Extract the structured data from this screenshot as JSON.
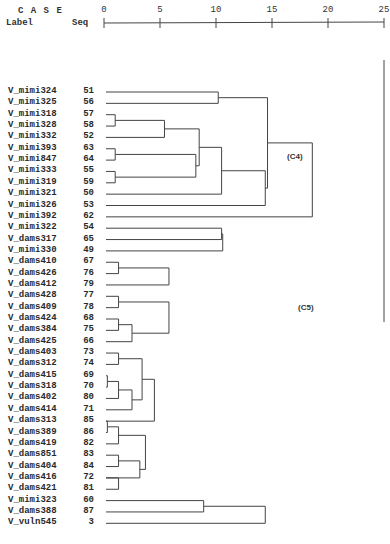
{
  "header": {
    "case_label": "C A S E",
    "label_col": "Label",
    "seq_col": "Seq"
  },
  "chart_data": {
    "type": "dendrogram",
    "title": "",
    "xlabel": "Rescaled Distance Cluster Combine",
    "axis_ticks": [
      0,
      5,
      10,
      15,
      20,
      25
    ],
    "xlim": [
      0,
      25
    ],
    "leaves": [
      {
        "label": "V_mimi324",
        "seq": 51
      },
      {
        "label": "V_mimi325",
        "seq": 56
      },
      {
        "label": "V_mimi318",
        "seq": 57
      },
      {
        "label": "V_mimi328",
        "seq": 58
      },
      {
        "label": "V_mimi332",
        "seq": 52
      },
      {
        "label": "V_mimi393",
        "seq": 63
      },
      {
        "label": "V_mimi847",
        "seq": 64
      },
      {
        "label": "V_mimi333",
        "seq": 55
      },
      {
        "label": "V_mimi319",
        "seq": 59
      },
      {
        "label": "V_mimi321",
        "seq": 50
      },
      {
        "label": "V_mimi326",
        "seq": 53
      },
      {
        "label": "V_mimi392",
        "seq": 62
      },
      {
        "label": "V_mimi322",
        "seq": 54
      },
      {
        "label": "V_dams317",
        "seq": 65
      },
      {
        "label": "V_mimi330",
        "seq": 49
      },
      {
        "label": "V_dams410",
        "seq": 67
      },
      {
        "label": "V_dams426",
        "seq": 76
      },
      {
        "label": "V_dams412",
        "seq": 79
      },
      {
        "label": "V_dams428",
        "seq": 77
      },
      {
        "label": "V_dams409",
        "seq": 78
      },
      {
        "label": "V_dams424",
        "seq": 68
      },
      {
        "label": "V_dams384",
        "seq": 75
      },
      {
        "label": "V_dams425",
        "seq": 66
      },
      {
        "label": "V_dams403",
        "seq": 73
      },
      {
        "label": "V_dams312",
        "seq": 74
      },
      {
        "label": "V_dams415",
        "seq": 69
      },
      {
        "label": "V_dams318",
        "seq": 70
      },
      {
        "label": "V_dams402",
        "seq": 80
      },
      {
        "label": "V_dams414",
        "seq": 71
      },
      {
        "label": "V_dams313",
        "seq": 85
      },
      {
        "label": "V_dams389",
        "seq": 86
      },
      {
        "label": "V_dams419",
        "seq": 82
      },
      {
        "label": "V_dams851",
        "seq": 83
      },
      {
        "label": "V_dams404",
        "seq": 84
      },
      {
        "label": "V_dams416",
        "seq": 72
      },
      {
        "label": "V_dams421",
        "seq": 81
      },
      {
        "label": "V_mimi323",
        "seq": 60
      },
      {
        "label": "V_dams388",
        "seq": 87
      },
      {
        "label": "V_vuln545",
        "seq": 3
      }
    ],
    "annotations": [
      {
        "text": "(C4)",
        "near_distance": 17
      },
      {
        "text": "(C5)",
        "near_distance": 17
      }
    ],
    "merges_approx": [
      {
        "rows": [
          0,
          1
        ],
        "distance": 10.2
      },
      {
        "rows": [
          2,
          3
        ],
        "distance": 1.0
      },
      {
        "rows": [
          5,
          6
        ],
        "distance": 1.0
      },
      {
        "rows": [
          7,
          8
        ],
        "distance": 1.0
      },
      {
        "rows": [
          "2-3",
          4
        ],
        "distance": 5.4
      },
      {
        "rows": [
          "5-6",
          "7-8"
        ],
        "distance": 8.2
      },
      {
        "rows": [
          "2-4",
          "5-8"
        ],
        "distance": 8.5
      },
      {
        "rows": [
          "2-8",
          9
        ],
        "distance": 10.5
      },
      {
        "rows": [
          "2-9",
          10
        ],
        "distance": 14.4
      },
      {
        "rows": [
          "0-1",
          "2-10"
        ],
        "distance": 14.6
      },
      {
        "rows": [
          "0-10",
          11
        ],
        "distance": 18.6
      },
      {
        "rows": [
          12,
          13
        ],
        "distance": 10.5
      },
      {
        "rows": [
          "12-13",
          14
        ],
        "distance": 10.6
      },
      {
        "rows": [
          15,
          16
        ],
        "distance": 1.3
      },
      {
        "rows": [
          "15-16",
          17
        ],
        "distance": 5.8
      },
      {
        "rows": [
          18,
          19
        ],
        "distance": 1.3
      },
      {
        "rows": [
          20,
          21
        ],
        "distance": 1.3
      },
      {
        "rows": [
          "20-21",
          22
        ],
        "distance": 2.5
      },
      {
        "rows": [
          "18-19",
          "20-22"
        ],
        "distance": 5.8
      },
      {
        "rows": [
          23,
          24
        ],
        "distance": 1.3
      },
      {
        "rows": [
          25,
          26
        ],
        "distance": 0.3
      },
      {
        "rows": [
          "25-26",
          27
        ],
        "distance": 1.3
      },
      {
        "rows": [
          "25-27",
          28
        ],
        "distance": 2.5
      },
      {
        "rows": [
          "23-24",
          "25-28"
        ],
        "distance": 3.4
      },
      {
        "rows": [
          "23-28",
          29
        ],
        "distance": 4.5
      },
      {
        "rows": [
          29,
          30
        ],
        "distance": 0.3
      },
      {
        "rows": [
          "29-30",
          31
        ],
        "distance": 1.3
      },
      {
        "rows": [
          32,
          33
        ],
        "distance": 1.3
      },
      {
        "rows": [
          "32-33",
          34
        ],
        "distance": 3.2
      },
      {
        "rows": [
          "29-31",
          "32-34"
        ],
        "distance": 3.7
      },
      {
        "rows": [
          34,
          35
        ],
        "distance": 1.3
      },
      {
        "rows": [
          "18-22",
          "23-35"
        ],
        "distance": 6.5
      },
      {
        "rows": [
          "15-17",
          "18-35"
        ],
        "distance": 8.9
      },
      {
        "rows": [
          36,
          37
        ],
        "distance": 8.9
      },
      {
        "rows": [
          "36-37",
          38
        ],
        "distance": 14.4
      },
      {
        "rows": [
          "15-35",
          "36-38"
        ],
        "distance": 15.0
      },
      {
        "rows": [
          "12-14",
          "15-38"
        ],
        "distance": 15.4
      },
      {
        "rows": [
          "0-11",
          "12-38"
        ],
        "distance": 25.0
      }
    ]
  },
  "labels": {
    "c4": "(C4)",
    "c5": "(C5)"
  }
}
